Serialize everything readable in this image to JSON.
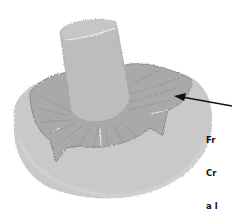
{
  "illustration": {
    "subject": "mushroom",
    "style": "grayscale watercolor",
    "parts": [
      "stem",
      "gills",
      "cap"
    ],
    "colors": {
      "cap": "#c9c9c9",
      "cap_edge": "#b8b8b8",
      "gills": "#a9a9a9",
      "gill_lines": "#8a8a8a",
      "stem": "#bdbdbd",
      "stem_top": "#c6c6c6",
      "arrow": "#111111",
      "background": "#ffffff"
    }
  },
  "annotation": {
    "lines": [
      "Fr",
      "Cr",
      "a l"
    ],
    "points_to": "gills"
  }
}
